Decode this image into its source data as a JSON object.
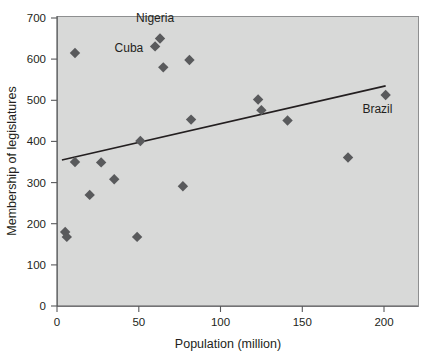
{
  "chart_data": {
    "type": "scatter",
    "title": "",
    "xlabel": "Population (million)",
    "ylabel": "Membership of legislatures",
    "xlim": [
      0,
      220
    ],
    "ylim": [
      0,
      700
    ],
    "xticks": [
      0,
      50,
      100,
      150,
      200
    ],
    "yticks": [
      0,
      100,
      200,
      300,
      400,
      500,
      600,
      700
    ],
    "grid": false,
    "legend": null,
    "plot_background": "#d8d9d8",
    "marker_color": "#595a5c",
    "marker_shape": "diamond",
    "trendline_color": "#231f20",
    "points": [
      {
        "x": 5,
        "y": 180,
        "label": ""
      },
      {
        "x": 6,
        "y": 168,
        "label": ""
      },
      {
        "x": 11,
        "y": 615,
        "label": ""
      },
      {
        "x": 11,
        "y": 350,
        "label": ""
      },
      {
        "x": 20,
        "y": 270,
        "label": ""
      },
      {
        "x": 27,
        "y": 349,
        "label": ""
      },
      {
        "x": 35,
        "y": 308,
        "label": ""
      },
      {
        "x": 49,
        "y": 168,
        "label": ""
      },
      {
        "x": 51,
        "y": 401,
        "label": ""
      },
      {
        "x": 60,
        "y": 631,
        "label": "Cuba"
      },
      {
        "x": 63,
        "y": 650,
        "label": "Nigeria"
      },
      {
        "x": 65,
        "y": 580,
        "label": ""
      },
      {
        "x": 77,
        "y": 291,
        "label": ""
      },
      {
        "x": 81,
        "y": 598,
        "label": ""
      },
      {
        "x": 82,
        "y": 453,
        "label": ""
      },
      {
        "x": 123,
        "y": 502,
        "label": ""
      },
      {
        "x": 125,
        "y": 476,
        "label": ""
      },
      {
        "x": 141,
        "y": 451,
        "label": ""
      },
      {
        "x": 178,
        "y": 361,
        "label": ""
      },
      {
        "x": 201,
        "y": 513,
        "label": "Brazil"
      }
    ],
    "trendline": {
      "x0": 3,
      "y0": 355,
      "x1": 201,
      "y1": 535
    },
    "annotations": [
      {
        "text": "Nigeria",
        "x": 60,
        "y": 690,
        "anchor": "middle"
      },
      {
        "text": "Cuba",
        "x": 44,
        "y": 617,
        "anchor": "middle"
      },
      {
        "text": "Brazil",
        "x": 196,
        "y": 470,
        "anchor": "middle"
      }
    ]
  },
  "axis": {
    "x_title": "Population (million)",
    "y_title": "Membership of legislatures",
    "x_tick_labels": [
      "0",
      "50",
      "100",
      "150",
      "200"
    ],
    "y_tick_labels": [
      "0",
      "100",
      "200",
      "300",
      "400",
      "500",
      "600",
      "700"
    ]
  },
  "labels": {
    "nigeria": "Nigeria",
    "cuba": "Cuba",
    "brazil": "Brazil"
  }
}
